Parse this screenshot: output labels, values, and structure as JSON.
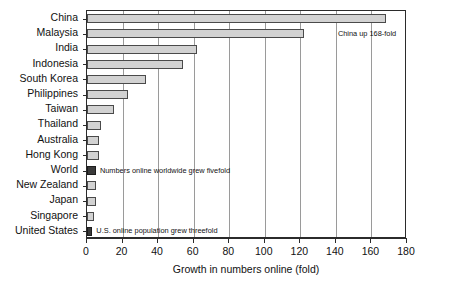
{
  "chart_data": {
    "type": "bar",
    "orientation": "horizontal",
    "title": "",
    "xlabel": "Growth in numbers online (fold)",
    "ylabel": "",
    "xlim": [
      0,
      180
    ],
    "ylim": null,
    "grid": true,
    "legend": "none",
    "xticks": [
      0,
      20,
      40,
      60,
      80,
      100,
      120,
      140,
      160,
      180
    ],
    "categories": [
      "China",
      "Malaysia",
      "India",
      "Indonesia",
      "South Korea",
      "Philippines",
      "Taiwan",
      "Thailand",
      "Australia",
      "Hong Kong",
      "World",
      "New Zealand",
      "Japan",
      "Singapore",
      "United States"
    ],
    "values": [
      168,
      122,
      62,
      54,
      33,
      23,
      15,
      8,
      7,
      7,
      5,
      5,
      5,
      4,
      3
    ],
    "bar_styles": [
      "light",
      "light",
      "light",
      "light",
      "light",
      "light",
      "light",
      "light",
      "light",
      "light",
      "dark",
      "light",
      "light",
      "light",
      "dark"
    ],
    "annotations": [
      {
        "text": "China up 168-fold",
        "category": "Malaysia"
      },
      {
        "text": "Numbers online worldwide grew fivefold",
        "category": "World"
      },
      {
        "text": "U.S. online population grew threefold",
        "category": "United States"
      }
    ],
    "colors": {
      "bar_light_fill": "#d2d2d2",
      "bar_dark_fill": "#3a3a3a",
      "bar_stroke": "#4a4a4a",
      "axis": "#2b2b2b",
      "gridline": "#9a9a9a",
      "text": "#111111",
      "background": "#ffffff"
    }
  }
}
